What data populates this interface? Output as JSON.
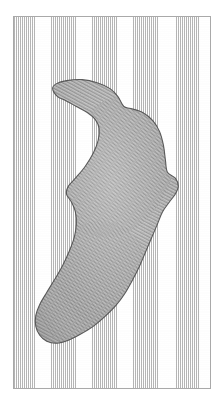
{
  "figure": {
    "domain": "scanned-engraving-plate",
    "width": 223,
    "height": 402,
    "caption": "",
    "title": "",
    "has_text_labels": false,
    "page_background": "#ffffff"
  },
  "frame": {
    "name": "plate-border",
    "x": 13,
    "y": 16,
    "width": 198,
    "height": 373,
    "stroke_color": "#a9a9a9",
    "stroke_width": 1,
    "fill_color": "#ffffff"
  },
  "background_texture": {
    "name": "vertical-stipple",
    "description": "fine vertical dotted ruling covering the whole plate",
    "dot_color": "#787878",
    "base_color": "#fdfdfd",
    "column_spacing_px": 2.05,
    "row_spacing_px": 1.9
  },
  "region": {
    "name": "hatched-region",
    "description": "irregular blob: upper-left lobe, concave notch at left-centre, right-hand protrusion near mid-height, tapering to a rounded tail at lower-left",
    "hatch_angle_deg": -62,
    "hatch_spacing_px": 3.0,
    "hatch_color": "#6e6e6e",
    "outline_color": "#4a4a4a",
    "fill_tone": "#b9b9b9",
    "outline_width": 1.1,
    "bounds": {
      "x": 33,
      "y": 78,
      "width": 143,
      "height": 272
    },
    "outline_points": [
      [
        57,
        96
      ],
      [
        52,
        88
      ],
      [
        56,
        83
      ],
      [
        66,
        80
      ],
      [
        82,
        79
      ],
      [
        97,
        82
      ],
      [
        110,
        88
      ],
      [
        118,
        96
      ],
      [
        124,
        106
      ],
      [
        131,
        108
      ],
      [
        143,
        112
      ],
      [
        153,
        120
      ],
      [
        160,
        131
      ],
      [
        164,
        145
      ],
      [
        166,
        160
      ],
      [
        168,
        172
      ],
      [
        176,
        178
      ],
      [
        179,
        186
      ],
      [
        176,
        194
      ],
      [
        170,
        202
      ],
      [
        163,
        212
      ],
      [
        158,
        224
      ],
      [
        152,
        238
      ],
      [
        146,
        252
      ],
      [
        140,
        266
      ],
      [
        133,
        280
      ],
      [
        125,
        294
      ],
      [
        116,
        306
      ],
      [
        105,
        317
      ],
      [
        93,
        327
      ],
      [
        80,
        335
      ],
      [
        68,
        341
      ],
      [
        56,
        344
      ],
      [
        46,
        342
      ],
      [
        39,
        336
      ],
      [
        35,
        327
      ],
      [
        35,
        316
      ],
      [
        39,
        305
      ],
      [
        46,
        293
      ],
      [
        54,
        280
      ],
      [
        62,
        266
      ],
      [
        69,
        251
      ],
      [
        74,
        237
      ],
      [
        76,
        224
      ],
      [
        75,
        212
      ],
      [
        71,
        202
      ],
      [
        66,
        194
      ],
      [
        68,
        186
      ],
      [
        76,
        177
      ],
      [
        85,
        166
      ],
      [
        93,
        153
      ],
      [
        98,
        140
      ],
      [
        99,
        128
      ],
      [
        95,
        119
      ],
      [
        87,
        112
      ],
      [
        76,
        106
      ],
      [
        65,
        100
      ]
    ],
    "notch_points": [
      [
        99,
        128
      ],
      [
        95,
        119
      ],
      [
        87,
        112
      ],
      [
        76,
        106
      ],
      [
        65,
        100
      ]
    ]
  },
  "palette": {
    "paper": "#ffffff",
    "frame_gray": "#a9a9a9",
    "stipple_gray": "#787878",
    "hatch_gray": "#6e6e6e",
    "outline_gray": "#4a4a4a",
    "shadow_gray": "#3c3c3c"
  }
}
